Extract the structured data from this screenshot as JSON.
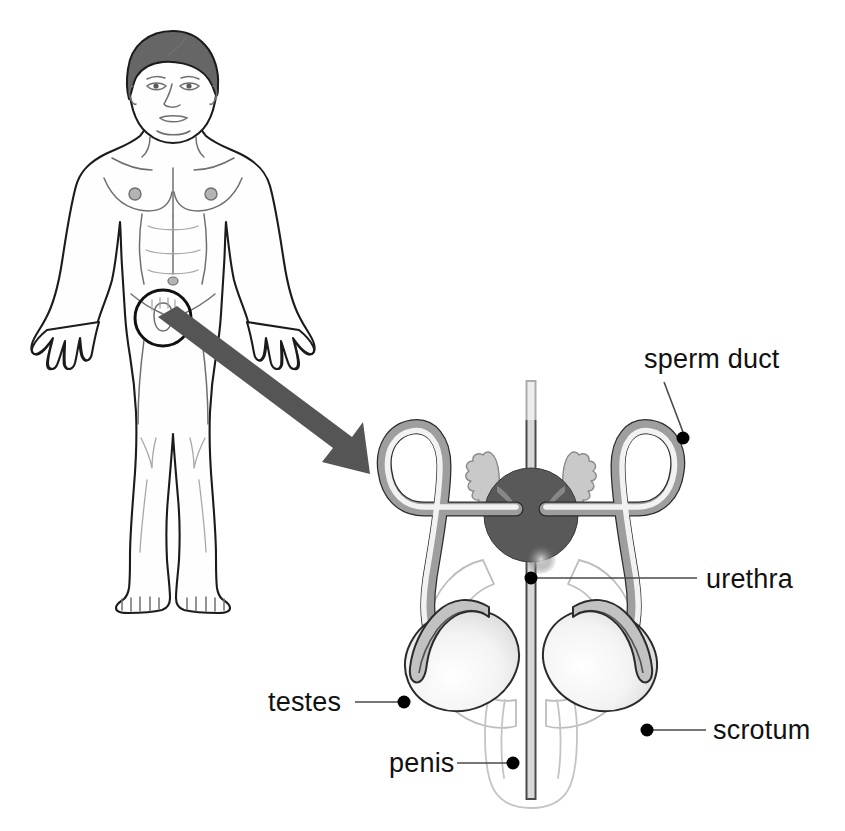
{
  "figure": {
    "background_color": "#ffffff",
    "width": 845,
    "height": 831
  },
  "palette": {
    "outline": "#1b1b1b",
    "hair": "#666666",
    "arrow": "#555555",
    "prostate": "#595959",
    "duct_edge": "#2b2b2b",
    "duct_fill": "#9e9e9e",
    "duct_highlight": "#f2f2f2",
    "epididymis": "#c2c2c2",
    "vesicle": "#c9c9c9",
    "scrotum_line": "#bdbdbd",
    "leader_line": "#4a4a4a",
    "label_text": "#111111"
  },
  "human_figure": {
    "name": "standing male body, front view",
    "magnifier_circle": {
      "cx": 163,
      "cy": 318,
      "r": 28
    },
    "arrow": {
      "from_x": 168,
      "from_y": 325,
      "to_x": 363,
      "to_y": 472
    }
  },
  "labels": [
    {
      "id": "sperm-duct",
      "text": "sperm duct",
      "text_x": 644,
      "text_y": 368,
      "anchor": "start",
      "dot_x": 683,
      "dot_y": 438,
      "leader": "M 683 432 L 664 382"
    },
    {
      "id": "urethra",
      "text": "urethra",
      "text_x": 706,
      "text_y": 588,
      "anchor": "start",
      "dot_x": 531,
      "dot_y": 578,
      "leader": "M 534 578 L 697 578"
    },
    {
      "id": "testes",
      "text": "testes",
      "text_x": 268,
      "text_y": 711,
      "anchor": "start",
      "dot_x": 404,
      "dot_y": 702,
      "leader": "M 401 702 L 355 702"
    },
    {
      "id": "scrotum",
      "text": "scrotum",
      "text_x": 713,
      "text_y": 739,
      "anchor": "start",
      "dot_x": 647,
      "dot_y": 730,
      "leader": "M 650 730 L 706 730"
    },
    {
      "id": "penis",
      "text": "penis",
      "text_x": 389,
      "text_y": 772,
      "anchor": "start",
      "dot_x": 513,
      "dot_y": 763,
      "leader": "M 510 763 L 457 763"
    }
  ],
  "anatomy_parts": [
    {
      "id": "prostate-gland",
      "label": "prostate gland"
    },
    {
      "id": "seminal-vesicle-left",
      "label": "seminal vesicle"
    },
    {
      "id": "seminal-vesicle-right",
      "label": "seminal vesicle"
    },
    {
      "id": "testis-left",
      "label": "testis"
    },
    {
      "id": "testis-right",
      "label": "testis"
    },
    {
      "id": "epididymis-left",
      "label": "epididymis"
    },
    {
      "id": "epididymis-right",
      "label": "epididymis"
    },
    {
      "id": "sperm-duct-left",
      "label": "sperm duct (vas deferens)"
    },
    {
      "id": "sperm-duct-right",
      "label": "sperm duct (vas deferens)"
    },
    {
      "id": "urethra-tube",
      "label": "urethra"
    },
    {
      "id": "penis-shaft",
      "label": "penis"
    },
    {
      "id": "scrotum-sac",
      "label": "scrotum"
    }
  ]
}
